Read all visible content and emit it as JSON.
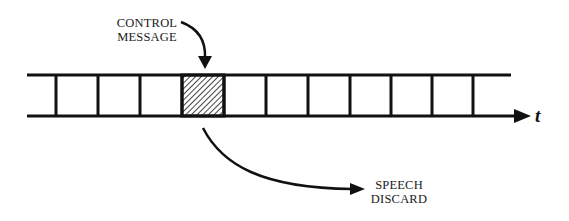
{
  "diagram": {
    "type": "time-slot-frame",
    "labels": {
      "control_message_line1": "CONTROL",
      "control_message_line2": "MESSAGE",
      "speech_discard_line1": "SPEECH",
      "speech_discard_line2": "DISCARD",
      "time_axis": "t"
    },
    "slots": {
      "count": 11,
      "highlighted_index": 4,
      "highlight_pattern": "diagonal-hatch"
    },
    "colors": {
      "line": "#111111",
      "background": "#ffffff",
      "hatch": "#444444"
    }
  }
}
